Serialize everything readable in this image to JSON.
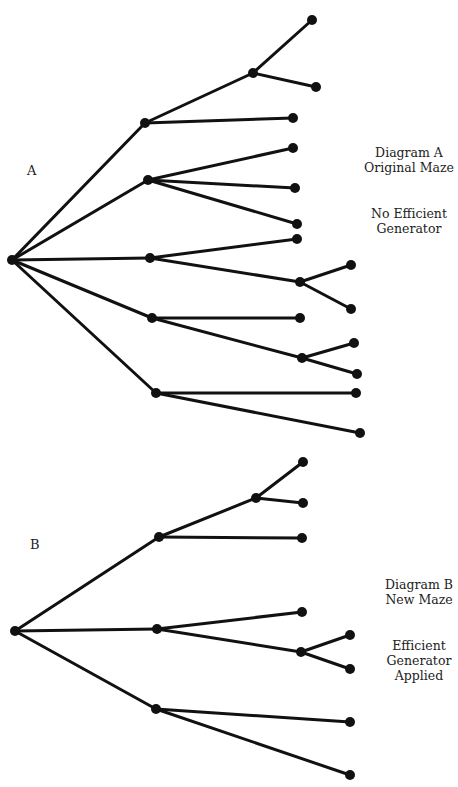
{
  "diagram_a": {
    "letter": "A",
    "caption_title": [
      "Diagram A",
      "Original Maze"
    ],
    "caption_note": [
      "No Efficient",
      "Generator"
    ],
    "nodes": [
      [
        12,
        260
      ],
      [
        145,
        123
      ],
      [
        148,
        180
      ],
      [
        150,
        258
      ],
      [
        152,
        318
      ],
      [
        156,
        393
      ],
      [
        253,
        73
      ],
      [
        293,
        118
      ],
      [
        293,
        148
      ],
      [
        295,
        188
      ],
      [
        297,
        224
      ],
      [
        297,
        239
      ],
      [
        300,
        282
      ],
      [
        302,
        358
      ],
      [
        300,
        318
      ],
      [
        356,
        393
      ],
      [
        360,
        433
      ],
      [
        312,
        20
      ],
      [
        316,
        87
      ],
      [
        351,
        265
      ],
      [
        351,
        309
      ],
      [
        354,
        343
      ],
      [
        357,
        374
      ]
    ],
    "edges": [
      [
        0,
        1
      ],
      [
        0,
        2
      ],
      [
        0,
        3
      ],
      [
        0,
        4
      ],
      [
        0,
        5
      ],
      [
        1,
        6
      ],
      [
        1,
        7
      ],
      [
        6,
        17
      ],
      [
        6,
        18
      ],
      [
        2,
        8
      ],
      [
        2,
        9
      ],
      [
        2,
        10
      ],
      [
        3,
        11
      ],
      [
        3,
        12
      ],
      [
        12,
        19
      ],
      [
        12,
        20
      ],
      [
        4,
        14
      ],
      [
        4,
        13
      ],
      [
        13,
        21
      ],
      [
        13,
        22
      ],
      [
        5,
        15
      ],
      [
        5,
        16
      ]
    ]
  },
  "diagram_b": {
    "letter": "B",
    "caption_title": [
      "Diagram B",
      "New Maze"
    ],
    "caption_note": [
      "Efficient",
      "Generator",
      "Applied"
    ],
    "nodes": [
      [
        15,
        631
      ],
      [
        159,
        537
      ],
      [
        157,
        629
      ],
      [
        156,
        709
      ],
      [
        256,
        498
      ],
      [
        302,
        538
      ],
      [
        302,
        612
      ],
      [
        301,
        652
      ],
      [
        350,
        722
      ],
      [
        350,
        775
      ],
      [
        303,
        462
      ],
      [
        303,
        503
      ],
      [
        350,
        635
      ],
      [
        350,
        669
      ]
    ],
    "edges": [
      [
        0,
        1
      ],
      [
        0,
        2
      ],
      [
        0,
        3
      ],
      [
        1,
        4
      ],
      [
        1,
        5
      ],
      [
        4,
        10
      ],
      [
        4,
        11
      ],
      [
        2,
        6
      ],
      [
        2,
        7
      ],
      [
        7,
        12
      ],
      [
        7,
        13
      ],
      [
        3,
        8
      ],
      [
        3,
        9
      ]
    ]
  }
}
